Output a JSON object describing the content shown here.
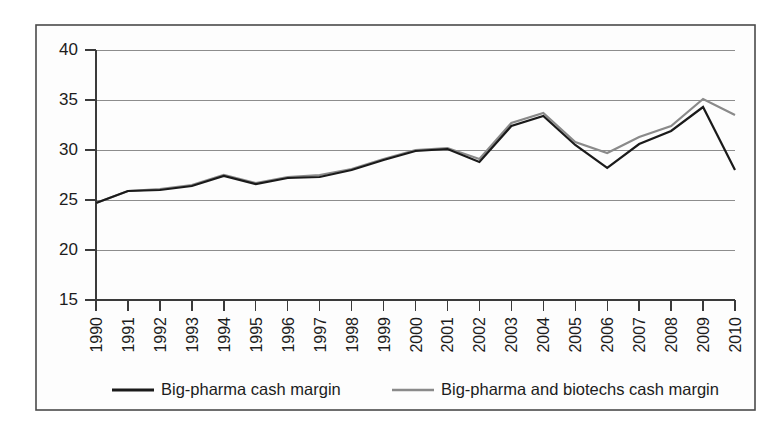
{
  "chart_data": {
    "type": "line",
    "title": "",
    "xlabel": "",
    "ylabel": "",
    "ylim": [
      15,
      40
    ],
    "yticks": [
      15,
      20,
      25,
      30,
      35,
      40
    ],
    "grid": true,
    "legend_position": "bottom",
    "categories": [
      "1990",
      "1991",
      "1992",
      "1993",
      "1994",
      "1995",
      "1996",
      "1997",
      "1998",
      "1999",
      "2000",
      "2001",
      "2002",
      "2003",
      "2004",
      "2005",
      "2006",
      "2007",
      "2008",
      "2009",
      "2010"
    ],
    "series": [
      {
        "name": "Big-pharma cash margin",
        "color": "#1a1a1a",
        "values": [
          24.7,
          25.9,
          26.0,
          26.4,
          27.4,
          26.6,
          27.2,
          27.3,
          28.0,
          29.0,
          29.9,
          30.1,
          28.8,
          32.4,
          33.4,
          30.5,
          28.2,
          30.6,
          31.9,
          34.3,
          28.0
        ]
      },
      {
        "name": "Big-pharma and biotechs cash margin",
        "color": "#8a8a8a",
        "values": [
          24.7,
          25.9,
          26.1,
          26.5,
          27.5,
          26.7,
          27.3,
          27.5,
          28.1,
          29.1,
          30.0,
          30.2,
          29.1,
          32.7,
          33.7,
          30.8,
          29.7,
          31.3,
          32.4,
          35.1,
          33.5
        ]
      }
    ]
  },
  "legend": {
    "items": [
      {
        "label": "Big-pharma cash margin",
        "color": "#1a1a1a"
      },
      {
        "label": "Big-pharma and biotechs cash margin",
        "color": "#8a8a8a"
      }
    ]
  }
}
